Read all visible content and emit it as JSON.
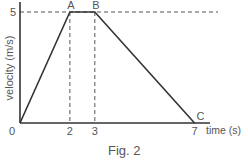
{
  "chart_data": {
    "type": "line",
    "title": "",
    "caption": "Fig. 2",
    "xlabel": "time (s)",
    "ylabel": "velocity (m/s)",
    "xlim": [
      0,
      7.7
    ],
    "ylim": [
      0,
      5.45
    ],
    "x_ticks": [
      {
        "value": 0,
        "label": "0"
      },
      {
        "value": 2,
        "label": "2"
      },
      {
        "value": 3,
        "label": "3"
      },
      {
        "value": 7,
        "label": "7"
      }
    ],
    "y_ticks": [
      {
        "value": 5,
        "label": "5"
      }
    ],
    "grid": false,
    "series": [
      {
        "name": "velocity",
        "x": [
          0,
          2,
          3,
          7
        ],
        "y": [
          0,
          5,
          5,
          0
        ]
      }
    ],
    "point_labels": [
      {
        "label": "A",
        "x": 2,
        "y": 5
      },
      {
        "label": "B",
        "x": 3,
        "y": 5
      },
      {
        "label": "C",
        "x": 7,
        "y": 0
      }
    ],
    "guides": [
      {
        "type": "horizontal-dashed",
        "y": 5
      },
      {
        "type": "vertical-dashed",
        "x": 2
      },
      {
        "type": "vertical-dashed",
        "x": 3
      }
    ],
    "colors": {
      "line": "#333333",
      "axis": "#333333",
      "dash": "#555555",
      "text": "#555555"
    }
  }
}
